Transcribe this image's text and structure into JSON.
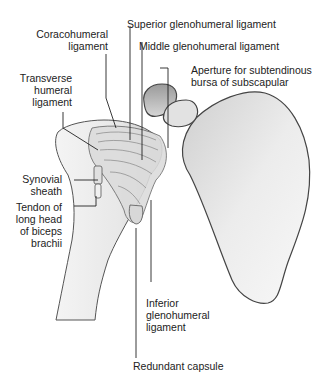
{
  "figure": {
    "labels": {
      "coracohumeral": [
        "Coracohumeral",
        "ligament"
      ],
      "superior_gh": [
        "Superior glenohumeral ligament"
      ],
      "middle_gh": [
        "Middle glenohumeral ligament"
      ],
      "aperture": [
        "Aperture for subtendinous",
        "bursa of subscapular"
      ],
      "transverse_humeral": [
        "Transverse",
        "humeral",
        "ligament"
      ],
      "synovial_sheath": [
        "Synovial",
        "sheath"
      ],
      "tendon_biceps": [
        "Tendon of",
        "long head",
        "of biceps",
        "brachii"
      ],
      "inferior_gh": [
        "Inferior",
        "glenohumeral",
        "ligament"
      ],
      "redundant_capsule": [
        "Redundant capsule"
      ]
    },
    "colors": {
      "bone_light": "#f4f4f4",
      "bone_shade": "#bdbdbd",
      "outline": "#444444",
      "leader_line": "#222222",
      "text": "#222222"
    }
  }
}
